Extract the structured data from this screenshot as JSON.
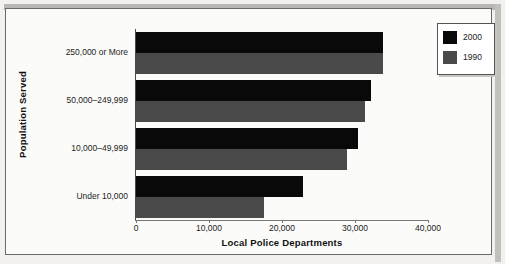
{
  "chart_data": {
    "type": "bar",
    "orientation": "horizontal",
    "title": "",
    "xlabel": "Local Police Departments",
    "ylabel": "Population Served",
    "categories": [
      "250,000 or More",
      "50,000–249,999",
      "10,000–49,999",
      "Under 10,000"
    ],
    "series": [
      {
        "name": "2000",
        "color": "#090909",
        "values": [
          33800,
          32200,
          30400,
          22900
        ]
      },
      {
        "name": "1990",
        "color": "#4a4a4a",
        "values": [
          33800,
          31400,
          28900,
          17600
        ]
      }
    ],
    "xlim": [
      0,
      40000
    ],
    "xticks": [
      0,
      10000,
      20000,
      30000,
      40000
    ],
    "xtick_labels": [
      "0",
      "10,000",
      "20,000",
      "30,000",
      "40,000"
    ],
    "grid": false,
    "legend_position": "top-right"
  },
  "legend": {
    "entries": [
      {
        "label": "2000",
        "color": "#090909"
      },
      {
        "label": "1990",
        "color": "#4a4a4a"
      }
    ]
  },
  "axes": {
    "x_title": "Local Police Departments",
    "y_title": "Population Served"
  }
}
